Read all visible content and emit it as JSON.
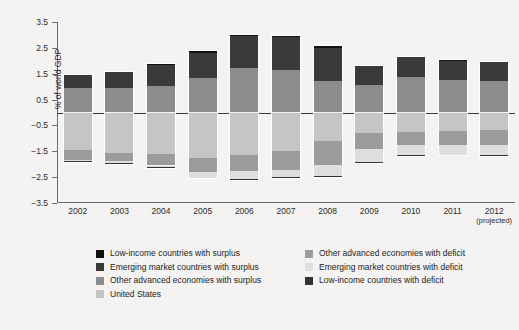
{
  "chart_data": {
    "type": "bar",
    "title": "",
    "subtitle": "",
    "xlabel": "",
    "ylabel": "% of world GDP",
    "stacked": true,
    "grid": false,
    "legend_position": "bottom",
    "ylim": [
      -3.5,
      3.5
    ],
    "yticks": [
      3.5,
      2.5,
      1.5,
      0.5,
      -0.5,
      -1.5,
      -2.5,
      -3.5
    ],
    "ytick_labels": [
      "3.5",
      "2.5",
      "1.5",
      "0.5",
      "−0.5",
      "−1.5",
      "−2.5",
      "−3.5"
    ],
    "categories": [
      "2002",
      "2003",
      "2004",
      "2005",
      "2006",
      "2007",
      "2008",
      "2009",
      "2010",
      "2011",
      "2012"
    ],
    "category_notes": {
      "2012": "(projected)"
    },
    "zero_line": 0,
    "series": [
      {
        "name": "Low-income countries with surplus",
        "color": "#101010",
        "side": "positive",
        "values": [
          0.04,
          0.05,
          0.06,
          0.08,
          0.09,
          0.09,
          0.1,
          0.05,
          0.06,
          0.06,
          0.06
        ]
      },
      {
        "name": "Emerging market countries with surplus",
        "color": "#3a3a3a",
        "side": "positive",
        "values": [
          0.51,
          0.61,
          0.8,
          0.98,
          1.24,
          1.26,
          1.3,
          0.73,
          0.78,
          0.75,
          0.72
        ]
      },
      {
        "name": "Other advanced economies with surplus",
        "color": "#8c8c8c",
        "side": "positive",
        "values": [
          0.95,
          0.94,
          1.04,
          1.34,
          1.72,
          1.65,
          1.2,
          1.07,
          1.36,
          1.25,
          1.22
        ]
      },
      {
        "name": "United States",
        "color": "#c5c5c3",
        "side": "negative",
        "values": [
          -1.45,
          -1.55,
          -1.62,
          -1.75,
          -1.65,
          -1.5,
          -1.1,
          -0.78,
          -0.75,
          -0.72,
          -0.68
        ]
      },
      {
        "name": "Other advanced economies with deficit",
        "color": "#9b9b9b",
        "side": "negative",
        "values": [
          -0.38,
          -0.34,
          -0.43,
          -0.56,
          -0.62,
          -0.72,
          -0.92,
          -0.62,
          -0.52,
          -0.55,
          -0.58
        ]
      },
      {
        "name": "Emerging market countries with deficit",
        "color": "#dedede",
        "side": "negative",
        "values": [
          -0.06,
          -0.06,
          -0.06,
          -0.21,
          -0.32,
          -0.28,
          -0.42,
          -0.52,
          -0.38,
          -0.36,
          -0.4
        ]
      },
      {
        "name": "Low-income countries with deficit",
        "color": "#333333",
        "side": "negative",
        "values": [
          -0.08,
          -0.07,
          -0.06,
          -0.06,
          -0.07,
          -0.07,
          -0.08,
          -0.06,
          -0.07,
          -0.07,
          -0.07
        ]
      }
    ]
  },
  "legend": {
    "left": [
      {
        "label": "Low-income countries with surplus",
        "color": "#101010"
      },
      {
        "label": "Emerging market countries with surplus",
        "color": "#3a3a3a"
      },
      {
        "label": "Other advanced economies with surplus",
        "color": "#8c8c8c"
      },
      {
        "label": "United States",
        "color": "#c5c5c3"
      }
    ],
    "right": [
      {
        "label": "Other advanced economies with deficit",
        "color": "#9b9b9b"
      },
      {
        "label": "Emerging market countries with deficit",
        "color": "#dedede"
      },
      {
        "label": "Low-income countries with deficit",
        "color": "#333333"
      }
    ]
  }
}
